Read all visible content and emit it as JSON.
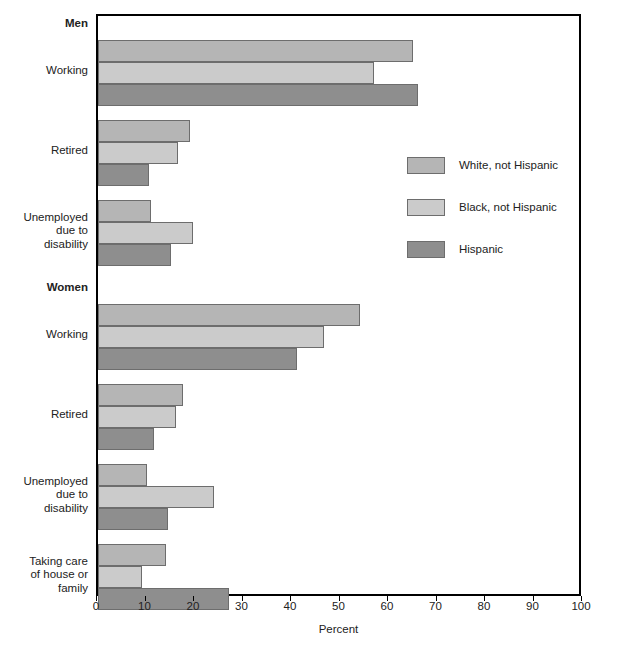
{
  "artifact": {
    "top_clipped_text": ""
  },
  "chart_data": {
    "type": "bar",
    "orientation": "horizontal",
    "title": "",
    "xlabel": "Percent",
    "ylabel": "",
    "xlim": [
      0,
      100
    ],
    "xticks": [
      0,
      10,
      20,
      30,
      40,
      50,
      60,
      70,
      80,
      90,
      100
    ],
    "grid": false,
    "legend_position": "right-middle",
    "series": [
      {
        "name": "White, not Hispanic",
        "color": "#b5b5b5"
      },
      {
        "name": "Black, not Hispanic",
        "color": "#cbcbcb"
      },
      {
        "name": "Hispanic",
        "color": "#8e8e8e"
      }
    ],
    "sections": [
      {
        "name": "Men",
        "groups": [
          {
            "category": "Working",
            "values": [
              65,
              57,
              66
            ]
          },
          {
            "category": "Retired",
            "values": [
              19,
              16.5,
              10.5
            ]
          },
          {
            "category": "Unemployed due to disability",
            "values": [
              11,
              19.5,
              15
            ]
          }
        ]
      },
      {
        "name": "Women",
        "groups": [
          {
            "category": "Working",
            "values": [
              54,
              46.5,
              41
            ]
          },
          {
            "category": "Retired",
            "values": [
              17.5,
              16,
              11.5
            ]
          },
          {
            "category": "Unemployed due to disability",
            "values": [
              10,
              24,
              14.5
            ]
          },
          {
            "category": "Taking care of house or family",
            "values": [
              14,
              9,
              27
            ]
          }
        ]
      }
    ],
    "category_labels": [
      {
        "text": "Men",
        "bold": true,
        "lines": [
          "Men"
        ]
      },
      {
        "text": "Working",
        "bold": false,
        "lines": [
          "Working"
        ]
      },
      {
        "text": "Retired",
        "bold": false,
        "lines": [
          "Retired"
        ]
      },
      {
        "text": "Unemployed due to disability",
        "bold": false,
        "lines": [
          "Unemployed",
          "due to",
          "disability"
        ]
      },
      {
        "text": "Women",
        "bold": true,
        "lines": [
          "Women"
        ]
      },
      {
        "text": "Working",
        "bold": false,
        "lines": [
          "Working"
        ]
      },
      {
        "text": "Retired",
        "bold": false,
        "lines": [
          "Retired"
        ]
      },
      {
        "text": "Unemployed due to disability",
        "bold": false,
        "lines": [
          "Unemployed",
          "due to",
          "disability"
        ]
      },
      {
        "text": "Taking care of house or family",
        "bold": false,
        "lines": [
          "Taking care",
          "of house or",
          "family"
        ]
      }
    ]
  },
  "axis": {
    "x_title": "Percent",
    "x_tick_labels": [
      "0",
      "10",
      "20",
      "30",
      "40",
      "50",
      "60",
      "70",
      "80",
      "90",
      "100"
    ]
  },
  "legend": {
    "items": [
      {
        "label": "White, not Hispanic"
      },
      {
        "label": "Black, not Hispanic"
      },
      {
        "label": "Hispanic"
      }
    ]
  }
}
